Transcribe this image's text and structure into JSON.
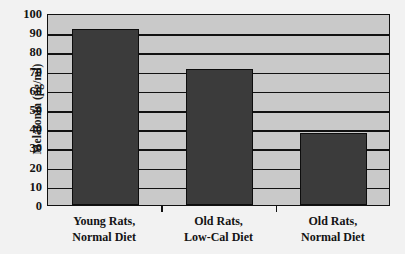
{
  "chart_data": {
    "type": "bar",
    "title": "",
    "subtitle": "",
    "xlabel": "",
    "ylabel": "Melatonin (pg/ml)",
    "categories": [
      "Young Rats, Normal Diet",
      "Old Rats, Low-Cal Diet",
      "Old Rats, Normal Diet"
    ],
    "category_lines": [
      [
        "Young Rats,",
        "Normal Diet"
      ],
      [
        "Old Rats,",
        "Low-Cal Diet"
      ],
      [
        "Old Rats,",
        "Normal Diet"
      ]
    ],
    "values": [
      91.5,
      71,
      37.5
    ],
    "ylim": [
      0,
      100
    ],
    "ytick_values": [
      0,
      10,
      20,
      30,
      40,
      50,
      60,
      70,
      80,
      90,
      100
    ],
    "ytick_labels": [
      "0",
      "10",
      "20",
      "30",
      "40",
      "50",
      "60",
      "70",
      "80",
      "90",
      "100"
    ],
    "grid": true,
    "grid_axis": "y",
    "legend": false,
    "legend_position": "none",
    "annotations": [],
    "colors": {
      "bar_fill": "#3b3b3b",
      "bar_edge": "#0d0d0d",
      "plot_background": "#c9c9c9",
      "figure_background": "#f2f2f2",
      "gridline": "#111111",
      "axis": "#111111",
      "text": "#141414"
    }
  }
}
